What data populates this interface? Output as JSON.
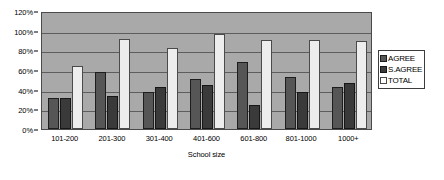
{
  "chart_data": {
    "type": "bar",
    "title": "",
    "subtitle": "",
    "xlabel": "School size",
    "ylabel": "",
    "categories": [
      "101-200",
      "201-300",
      "301-400",
      "401-600",
      "601-800",
      "801-1000",
      "1000+"
    ],
    "series": [
      {
        "name": "AGREE",
        "values": [
          32,
          58,
          38,
          51,
          68,
          53,
          43
        ]
      },
      {
        "name": "S.AGREE",
        "values": [
          32,
          34,
          43,
          45,
          24,
          38,
          47
        ]
      },
      {
        "name": "TOTAL",
        "values": [
          64,
          92,
          82,
          97,
          91,
          91,
          89
        ]
      }
    ],
    "ylim": [
      0,
      120
    ],
    "ytick_values": [
      0,
      20,
      40,
      60,
      80,
      100,
      120
    ],
    "ytick_labels": [
      "0%",
      "20%",
      "40%",
      "60%",
      "80%",
      "100%",
      "120%"
    ],
    "grid": true,
    "legend_position": "right",
    "legend_entries": [
      "AGREE",
      "S.AGREE",
      "TOTAL"
    ],
    "annotations": []
  },
  "axes": {
    "x_title": "School size"
  },
  "legend": {
    "items": [
      {
        "label": "AGREE",
        "swatch": "legend-swatch-agree",
        "color": "#565656"
      },
      {
        "label": "S.AGREE",
        "swatch": "legend-swatch-s-agree",
        "color": "#3a3a3a"
      },
      {
        "label": "TOTAL",
        "swatch": "legend-swatch-total",
        "color": "#ffffff"
      }
    ]
  },
  "colors": {
    "plot_background": "#a9a9a9",
    "page_background": "#ffffff",
    "gridline": "#5d5d5d",
    "frame": "#4a4a4a",
    "agree": "#565656",
    "s_agree": "#3a3a3a",
    "total": "#ededed",
    "text": "#000000"
  }
}
